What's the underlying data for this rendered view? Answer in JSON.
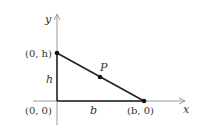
{
  "diagram": {
    "axes": {
      "x_label": "x",
      "y_label": "y"
    },
    "points": {
      "origin": "(0, 0)",
      "top": "(0, h)",
      "right": "(b, 0)",
      "mid": "P"
    },
    "segment_labels": {
      "height": "h",
      "base": "b"
    },
    "colors": {
      "axis": "#999999",
      "line": "#222222",
      "text": "#333333"
    }
  }
}
